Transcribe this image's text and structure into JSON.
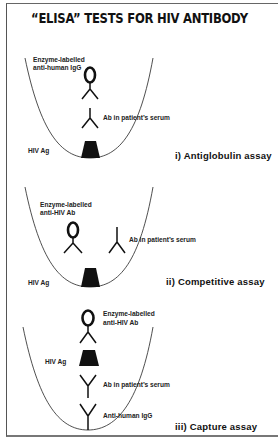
{
  "title": "“ELISA” TESTS FOR HIV ANTIBODY",
  "colors": {
    "ink": "#111111",
    "background": "#ffffff",
    "frame": "#666666"
  },
  "panels": [
    {
      "id": "antiglobulin",
      "assay_label": "i)  Antiglobulin assay",
      "labels": {
        "enzyme_line1": "Enzyme-labelled",
        "enzyme_line2": "anti-human IgG",
        "ab_serum": "Ab in patient’s serum",
        "hiv_ag": "HIV Ag"
      }
    },
    {
      "id": "competitive",
      "assay_label": "ii)  Competitive assay",
      "labels": {
        "enzyme_line1": "Enzyme-labelled",
        "enzyme_line2": "anti-HIV Ab",
        "ab_serum": "Ab in patient’s serum",
        "hiv_ag": "HIV Ag"
      }
    },
    {
      "id": "capture",
      "assay_label": "iii)  Capture assay",
      "labels": {
        "enzyme_line1": "Enzyme-labelled",
        "enzyme_line2": "anti-HIV Ab",
        "hiv_ag": "HIV Ag",
        "ab_serum": "Ab in patient’s serum",
        "anti_human": "Anti-human IgG"
      }
    }
  ],
  "icons": {
    "enzyme": "enzyme-labelled-antibody-icon (O on inverted V)",
    "antibody": "y-shaped-antibody-icon",
    "antigen": "trapezoid-antigen-icon",
    "well": "u-shaped-well-icon"
  }
}
